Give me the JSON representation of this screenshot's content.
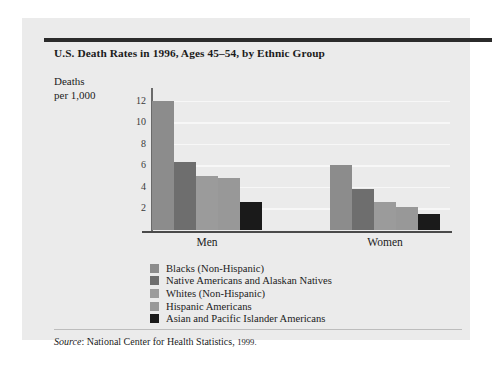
{
  "figure": {
    "title": "U.S. Death Rates in 1996, Ages 45–54, by Ethnic Group",
    "axis_title_line1": "Deaths",
    "axis_title_line2": "per 1,000",
    "source_prefix": "Source",
    "source_text": ": National Center for Health Statistics,",
    "source_year": "1999."
  },
  "chart_data": {
    "type": "bar",
    "title": "U.S. Death Rates in 1996, Ages 45–54, by Ethnic Group",
    "xlabel": "",
    "ylabel": "Deaths per 1,000",
    "ylim": [
      0,
      13
    ],
    "yticks": [
      2,
      4,
      6,
      8,
      10,
      12
    ],
    "grid": true,
    "legend_position": "below-plot",
    "categories": [
      "Men",
      "Women"
    ],
    "series": [
      {
        "name": "Blacks (Non-Hispanic)",
        "color": "#8c8c8c",
        "values": [
          12.0,
          6.0
        ]
      },
      {
        "name": "Native Americans and Alaskan Natives",
        "color": "#6e6e6e",
        "values": [
          6.3,
          3.8
        ]
      },
      {
        "name": "Whites (Non-Hispanic)",
        "color": "#9b9b9b",
        "values": [
          5.0,
          2.6
        ]
      },
      {
        "name": "Hispanic Americans",
        "color": "#989898",
        "values": [
          4.8,
          2.1
        ]
      },
      {
        "name": "Asian and Pacific Islander Americans",
        "color": "#1a1a1a",
        "values": [
          2.6,
          1.5
        ]
      }
    ]
  }
}
